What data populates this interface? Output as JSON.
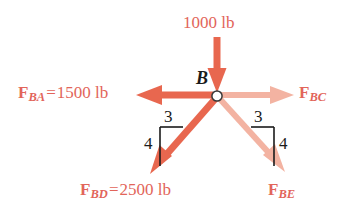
{
  "diagram": {
    "background_color": "#ffffff",
    "joint": {
      "label": "B",
      "node_color": "#ffffff",
      "node_outline_color": "#3a3a3a"
    },
    "colors": {
      "force_strong": "#e8674f",
      "force_medium": "#ea6a52",
      "force_faded": "#f3b3a2",
      "text_red": "#e2655a",
      "text_black": "#1b1b1b"
    },
    "applied_load": {
      "name": "applied-load-1000",
      "label": "1000 lb",
      "value": 1000,
      "units": "lb",
      "direction": "down",
      "color": "#e8674f"
    },
    "forces": [
      {
        "name": "force-ba",
        "symbol": "F",
        "subscript": "BA",
        "equals": "=",
        "value_label": "1500 lb",
        "value": 1500,
        "units": "lb",
        "direction": "left",
        "emphasis": "strong",
        "color": "#e8674f"
      },
      {
        "name": "force-bc",
        "symbol": "F",
        "subscript": "BC",
        "equals": "",
        "value_label": "",
        "value": null,
        "units": "lb",
        "direction": "right",
        "emphasis": "faded",
        "color": "#f3b3a2"
      },
      {
        "name": "force-bd",
        "symbol": "F",
        "subscript": "BD",
        "equals": "=",
        "value_label": "2500 lb",
        "value": 2500,
        "units": "lb",
        "direction": "down-left",
        "emphasis": "strong",
        "color": "#e8674f"
      },
      {
        "name": "force-be",
        "symbol": "F",
        "subscript": "BE",
        "equals": "",
        "value_label": "",
        "value": null,
        "units": "lb",
        "direction": "down-right",
        "emphasis": "faded",
        "color": "#f3b3a2"
      }
    ],
    "slope_triangles": [
      {
        "name": "slope-triangle-left",
        "for_force": "force-bd",
        "run_label": "3",
        "rise_label": "4",
        "run": 3,
        "rise": 4,
        "side": "left"
      },
      {
        "name": "slope-triangle-right",
        "for_force": "force-be",
        "run_label": "3",
        "rise_label": "4",
        "run": 3,
        "rise": 4,
        "side": "right"
      }
    ]
  }
}
